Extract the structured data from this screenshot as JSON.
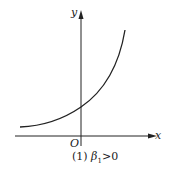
{
  "axes": {
    "x_label": "x",
    "y_label": "y",
    "origin_label": "O"
  },
  "caption": {
    "number": "(1)",
    "symbol": "β",
    "subscript": "1",
    "condition": ">0"
  },
  "curve": {
    "type": "exponential growth",
    "description": "increasing convex curve approaching an asymptote from above on the left, crossing the positive y-axis"
  }
}
